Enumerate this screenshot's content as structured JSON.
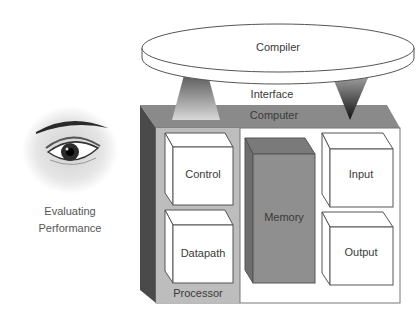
{
  "diagram": {
    "compiler_label": "Compiler",
    "interface_label": "Interface",
    "computer_label": "Computer",
    "processor_label": "Processor",
    "control_label": "Control",
    "datapath_label": "Datapath",
    "memory_label": "Memory",
    "input_label": "Input",
    "output_label": "Output",
    "side_caption_line1": "Evaluating",
    "side_caption_line2": "Performance"
  },
  "colors": {
    "computer_top": "#8a8a8a",
    "computer_side": "#4a4a4a",
    "processor_bg": "#bdbdbd",
    "memory_front": "#8f8f8f",
    "memory_top": "#7a7a7a",
    "outline": "#444444"
  }
}
